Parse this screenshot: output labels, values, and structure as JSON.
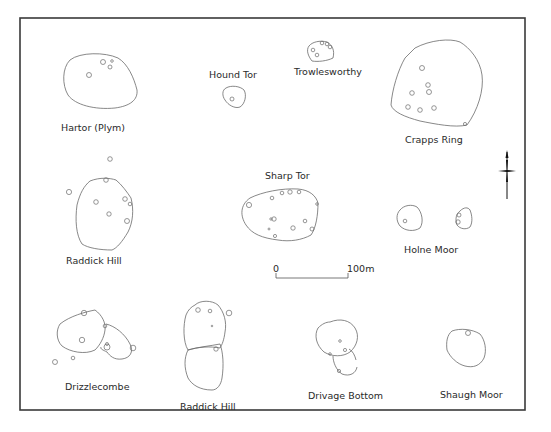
{
  "figure": {
    "type": "comparative plans of prehistoric enclosures with hut circles",
    "sites": [
      {
        "id": "hartor-plym",
        "label": "Hartor (Plym)"
      },
      {
        "id": "hound-tor",
        "label": "Hound Tor"
      },
      {
        "id": "trowlesworthy",
        "label": "Trowlesworthy"
      },
      {
        "id": "crapps-ring",
        "label": "Crapps Ring"
      },
      {
        "id": "raddick-hill-1",
        "label": "Raddick Hill"
      },
      {
        "id": "sharp-tor",
        "label": "Sharp Tor"
      },
      {
        "id": "holne-moor",
        "label": "Holne Moor"
      },
      {
        "id": "drizzlecombe",
        "label": "Drizzlecombe"
      },
      {
        "id": "raddick-hill-2",
        "label": "Raddick Hill"
      },
      {
        "id": "drivage-bottom",
        "label": "Drivage Bottom"
      },
      {
        "id": "shaugh-moor",
        "label": "Shaugh Moor"
      }
    ],
    "scale_bar": {
      "start_label": "0",
      "end_label": "100m"
    },
    "north_arrow": {
      "icon": "north-arrow-icon"
    }
  }
}
